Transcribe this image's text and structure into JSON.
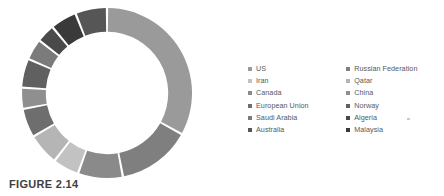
{
  "caption": "FIGURE 2.14",
  "legend": {
    "columns": [
      {
        "items": [
          {
            "label": "US",
            "color": "#9a9a9a"
          },
          {
            "label": "Iran",
            "color": "#c2c2c2"
          },
          {
            "label": "Canada",
            "color": "#8a8a8a"
          },
          {
            "label": "European Union",
            "color": "#6e6e6e"
          },
          {
            "label": "Saudi Arabia",
            "color": "#7b7b7b"
          },
          {
            "label": "Australia",
            "color": "#565656"
          }
        ]
      },
      {
        "items": [
          {
            "label": "Russian Federation",
            "color": "#7f7f7f"
          },
          {
            "label": "Qatar",
            "color": "#b5b5b5"
          },
          {
            "label": "China",
            "color": "#8f8f8f"
          },
          {
            "label": "Norway",
            "color": "#606060"
          },
          {
            "label": "Algeria",
            "color": "#4a4a4a"
          },
          {
            "label": "Malaysia",
            "color": "#3a3a3a"
          }
        ]
      }
    ]
  },
  "chart_data": {
    "type": "pie",
    "variant": "donut",
    "title": "FIGURE 2.14",
    "xlabel": "",
    "ylabel": "",
    "legend_position": "right",
    "grid": false,
    "start_angle_deg": 0,
    "direction": "clockwise",
    "inner_radius_ratio": 0.72,
    "units": "percent",
    "categories": [
      "US",
      "Russian Federation",
      "Canada",
      "Iran",
      "Qatar",
      "European Union",
      "China",
      "Norway",
      "Saudi Arabia",
      "Algeria",
      "Malaysia",
      "Australia"
    ],
    "values": [
      33.0,
      14.0,
      8.5,
      5.0,
      6.0,
      5.5,
      4.0,
      5.5,
      4.0,
      3.5,
      5.0,
      6.0
    ],
    "colors": [
      "#9a9a9a",
      "#7f7f7f",
      "#8a8a8a",
      "#c2c2c2",
      "#b5b5b5",
      "#6e6e6e",
      "#8f8f8f",
      "#606060",
      "#7b7b7b",
      "#4a4a4a",
      "#3a3a3a",
      "#565656"
    ]
  }
}
